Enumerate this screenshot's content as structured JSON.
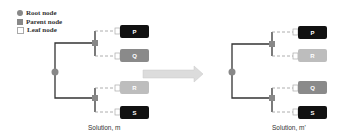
{
  "legend": {
    "items": [
      {
        "label": "Root node",
        "shape": "circle",
        "color": "#888888"
      },
      {
        "label": "Parent node",
        "shape": "square",
        "color": "#888888"
      },
      {
        "label": "Leaf node",
        "shape": "outlined-square",
        "color": "#ffffff"
      }
    ]
  },
  "left_tree": {
    "caption": "Solution, m",
    "leaves": [
      {
        "label": "P",
        "color": "#111111"
      },
      {
        "label": "Q",
        "color": "#8a8a8a"
      },
      {
        "label": "R",
        "color": "#bdbdbd"
      },
      {
        "label": "S",
        "color": "#111111"
      }
    ]
  },
  "right_tree": {
    "caption": "Solution, m'",
    "leaves": [
      {
        "label": "P",
        "color": "#111111"
      },
      {
        "label": "R",
        "color": "#bdbdbd"
      },
      {
        "label": "Q",
        "color": "#8a8a8a"
      },
      {
        "label": "S",
        "color": "#111111"
      }
    ]
  },
  "arrow": {
    "color": "#d9d9d9",
    "direction": "right"
  }
}
